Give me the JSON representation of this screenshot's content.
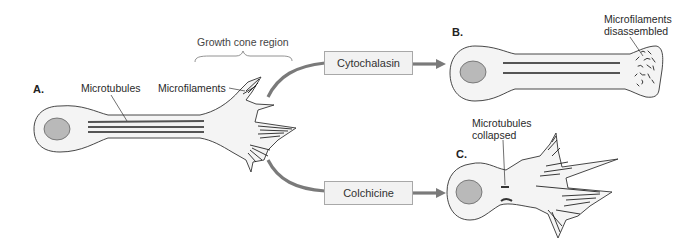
{
  "figure": {
    "colors": {
      "cell_fill": "#f4f4f4",
      "cell_outline": "#333333",
      "nucleus_fill": "#b9b9b9",
      "microtubule": "#555555",
      "arrow": "#7a7a7a",
      "box_fill": "#f2f2f2",
      "box_border": "#a8a8a8"
    }
  },
  "panel_a": {
    "label": "A.",
    "microtubules_label": "Microtubules",
    "microfilaments_label": "Microfilaments",
    "growth_cone_label": "Growth cone region"
  },
  "treatments": [
    {
      "label": "Cytochalasin",
      "target_panel": "B."
    },
    {
      "label": "Colchicine",
      "target_panel": "C."
    }
  ],
  "panel_b": {
    "label": "B.",
    "annotation_line1": "Microfilaments",
    "annotation_line2": "disassembled"
  },
  "panel_c": {
    "label": "C.",
    "annotation_line1": "Microtubules",
    "annotation_line2": "collapsed"
  }
}
